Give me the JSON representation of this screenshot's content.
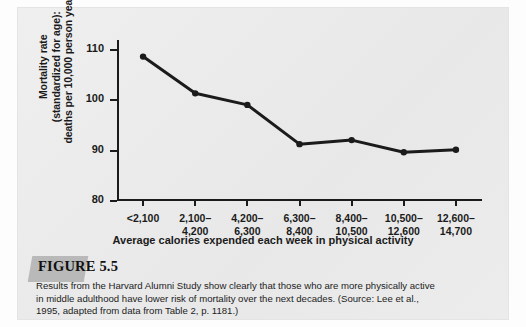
{
  "figure": {
    "tab_label": "FIGURE 5.5",
    "caption_lines": [
      "Results from the Harvard Alumni Study show clearly that those who are more physically active",
      "in middle adulthood have lower risk of mortality over the next decades. (Source: Lee et al.,",
      "1995, adapted from data from Table 2, p. 1181.)"
    ]
  },
  "axis": {
    "ylabel_line1": "Mortality rate",
    "ylabel_line2": "(standardized for age):",
    "ylabel_line3": "deaths per 10,000 person years",
    "xlabel": "Average calories expended each week in physical activity"
  },
  "colors": {
    "panel_bg": "#ebebeb",
    "ink": "#1b1b1b",
    "line": "#1b1b1b",
    "tab": "#b9b9b9"
  },
  "chart_data": {
    "type": "line",
    "title": "",
    "xlabel": "Average calories expended each week in physical activity",
    "ylabel": "Mortality rate (standardized for age): deaths per 10,000 person years",
    "categories": [
      "<2,100",
      "2,100–\n4,200",
      "4,200–\n6,300",
      "6,300–\n8,400",
      "8,400–\n10,500",
      "10,500–\n12,600",
      "12,600–\n14,700"
    ],
    "category_lines": [
      [
        "<2,100",
        ""
      ],
      [
        "2,100–",
        "4,200"
      ],
      [
        "4,200–",
        "6,300"
      ],
      [
        "6,300–",
        "8,400"
      ],
      [
        "8,400–",
        "10,500"
      ],
      [
        "10,500–",
        "12,600"
      ],
      [
        "12,600–",
        "14,700"
      ]
    ],
    "values": [
      108.7,
      101.4,
      99.1,
      91.3,
      92.1,
      89.7,
      90.2
    ],
    "ylim": [
      80,
      112
    ],
    "yticks": [
      80,
      90,
      100,
      110
    ],
    "ytick_labels": [
      "80",
      "90",
      "100",
      "110"
    ],
    "grid": false,
    "legend": false,
    "marker": "filled-circle",
    "series_color": "#1b1b1b"
  }
}
